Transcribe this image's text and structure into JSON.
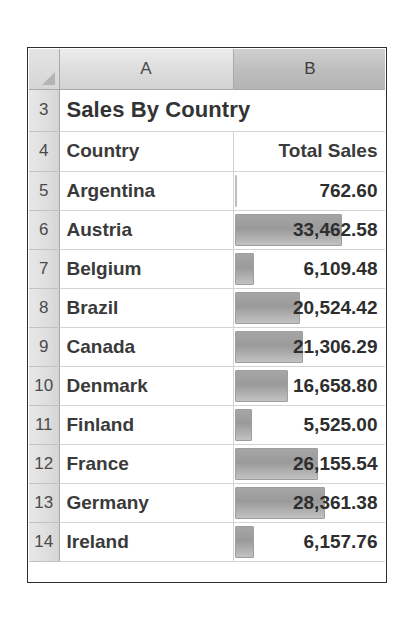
{
  "sheet": {
    "corner_icon": "select-all-triangle-icon",
    "column_headers": [
      {
        "label": "A",
        "selected": false
      },
      {
        "label": "B",
        "selected": true
      }
    ],
    "title": {
      "row_number": "3",
      "text": "Sales By Country"
    },
    "header": {
      "row_number": "4",
      "country_label": "Country",
      "total_sales_label": "Total Sales"
    },
    "rows": [
      {
        "row_number": "5",
        "country": "Argentina",
        "value_text": "762.60",
        "value": 762.6
      },
      {
        "row_number": "6",
        "country": "Austria",
        "value_text": "33,462.58",
        "value": 33462.58
      },
      {
        "row_number": "7",
        "country": "Belgium",
        "value_text": "6,109.48",
        "value": 6109.48
      },
      {
        "row_number": "8",
        "country": "Brazil",
        "value_text": "20,524.42",
        "value": 20524.42
      },
      {
        "row_number": "9",
        "country": "Canada",
        "value_text": "21,306.29",
        "value": 21306.29
      },
      {
        "row_number": "10",
        "country": "Denmark",
        "value_text": "16,658.80",
        "value": 16658.8
      },
      {
        "row_number": "11",
        "country": "Finland",
        "value_text": "5,525.00",
        "value": 5525.0
      },
      {
        "row_number": "12",
        "country": "France",
        "value_text": "26,155.54",
        "value": 26155.54
      },
      {
        "row_number": "13",
        "country": "Germany",
        "value_text": "28,361.38",
        "value": 28361.38
      },
      {
        "row_number": "14",
        "country": "Ireland",
        "value_text": "6,157.76",
        "value": 6157.76
      }
    ],
    "data_bar": {
      "max_value": 33462.58,
      "max_width_pct": 70,
      "fill_color": "#9a9a9a",
      "border_color": "#9e9e9e"
    }
  },
  "chart_data": {
    "type": "bar",
    "title": "Sales By Country",
    "xlabel": "Country",
    "ylabel": "Total Sales",
    "categories": [
      "Argentina",
      "Austria",
      "Belgium",
      "Brazil",
      "Canada",
      "Denmark",
      "Finland",
      "France",
      "Germany",
      "Ireland"
    ],
    "values": [
      762.6,
      33462.58,
      6109.48,
      20524.42,
      21306.29,
      16658.8,
      5525.0,
      26155.54,
      28361.38,
      6157.76
    ],
    "ylim": [
      0,
      33462.58
    ],
    "grid": true,
    "legend": "none",
    "note": "Excel conditional-formatting data bars rendered inside the Total Sales column"
  }
}
